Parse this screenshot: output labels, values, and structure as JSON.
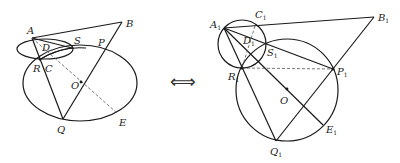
{
  "figure_left": {
    "labels": {
      "A": "A",
      "B": "B",
      "S": "S",
      "P": "P",
      "D": "D",
      "R": "R",
      "C": "C",
      "O": "O",
      "Q": "Q",
      "E": "E"
    }
  },
  "equivalence_symbol": "⟺",
  "figure_right": {
    "labels": {
      "A": "A",
      "A_sub": "1",
      "B": "B",
      "B_sub": "1",
      "C": "C",
      "C_sub": "1",
      "D": "D",
      "D_sub": "1",
      "S": "S",
      "S_sub": "1",
      "P": "P",
      "P_sub": "1",
      "R": "R",
      "R_sub": "1",
      "O": "O",
      "Q": "Q",
      "Q_sub": "1",
      "E": "E",
      "E_sub": "1"
    }
  },
  "colors": {
    "stroke": "#1a1a1a",
    "dashed": "#555555",
    "background": "#ffffff"
  }
}
